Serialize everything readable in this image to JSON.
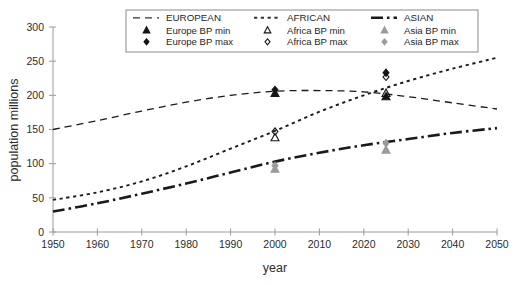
{
  "axes": {
    "xlabel": "year",
    "ylabel": "population  millions",
    "xticks": [
      "1950",
      "1960",
      "1970",
      "1980",
      "1990",
      "2000",
      "2010",
      "2020",
      "2030",
      "2040",
      "2050"
    ],
    "yticks": [
      "0",
      "50",
      "100",
      "150",
      "200",
      "250",
      "300"
    ]
  },
  "legend": {
    "columns": [
      {
        "header": "EUROPEAN",
        "header_icon": "dashed-line-swatch",
        "entries": [
          {
            "label": "Europe  BP min",
            "icon": "filled-triangle-marker"
          },
          {
            "label": "Europe BP max",
            "icon": "filled-diamond-marker"
          }
        ]
      },
      {
        "header": "AFRICAN",
        "header_icon": "dotted-line-swatch",
        "entries": [
          {
            "label": "Africa BP min",
            "icon": "open-triangle-marker"
          },
          {
            "label": "Africa BP max",
            "icon": "open-diamond-marker"
          }
        ]
      },
      {
        "header": "ASIAN",
        "header_icon": "dashdot-line-swatch",
        "entries": [
          {
            "label": "Asia  BP min",
            "icon": "grey-triangle-marker"
          },
          {
            "label": "Asia BP max",
            "icon": "grey-diamond-marker"
          }
        ]
      }
    ]
  },
  "colors": {
    "european": "#333333",
    "african": "#333333",
    "asian": "#1a1a1a",
    "grey_marker": "#9b9b9b",
    "axis": "#9a9a9a",
    "background": "#ffffff"
  },
  "chart_data": {
    "type": "line",
    "title": "",
    "xlabel": "year",
    "ylabel": "population  millions",
    "xlim": [
      1950,
      2050
    ],
    "ylim": [
      0,
      300
    ],
    "grid": false,
    "legend_position": "top",
    "x": [
      1950,
      1960,
      1970,
      1980,
      1990,
      2000,
      2010,
      2020,
      2030,
      2040,
      2050
    ],
    "series": [
      {
        "name": "EUROPEAN",
        "style": "dashed",
        "values": [
          150,
          163,
          177,
          190,
          200,
          206,
          207,
          205,
          198,
          189,
          180
        ]
      },
      {
        "name": "AFRICAN",
        "style": "dotted",
        "values": [
          47,
          58,
          74,
          96,
          122,
          148,
          176,
          200,
          221,
          239,
          255
        ]
      },
      {
        "name": "ASIAN",
        "style": "dash-dot",
        "values": [
          30,
          42,
          56,
          71,
          87,
          103,
          116,
          127,
          136,
          145,
          152
        ]
      }
    ],
    "markers": [
      {
        "series": "Europe BP min",
        "x": 2000,
        "y": 203,
        "icon": "filled-triangle-marker"
      },
      {
        "series": "Europe BP max",
        "x": 2000,
        "y": 208,
        "icon": "filled-diamond-marker"
      },
      {
        "series": "Africa BP min",
        "x": 2000,
        "y": 138,
        "icon": "open-triangle-marker"
      },
      {
        "series": "Africa BP max",
        "x": 2000,
        "y": 147,
        "icon": "open-diamond-marker"
      },
      {
        "series": "Asia BP min",
        "x": 2000,
        "y": 92,
        "icon": "grey-triangle-marker"
      },
      {
        "series": "Asia BP max",
        "x": 2000,
        "y": 97,
        "icon": "grey-diamond-marker"
      },
      {
        "series": "Europe BP min",
        "x": 2025,
        "y": 198,
        "icon": "filled-triangle-marker"
      },
      {
        "series": "Europe BP max",
        "x": 2025,
        "y": 233,
        "icon": "filled-diamond-marker"
      },
      {
        "series": "Africa BP min",
        "x": 2025,
        "y": 203,
        "icon": "open-triangle-marker"
      },
      {
        "series": "Africa BP max",
        "x": 2025,
        "y": 227,
        "icon": "open-diamond-marker"
      },
      {
        "series": "Asia BP min",
        "x": 2025,
        "y": 120,
        "icon": "grey-triangle-marker"
      },
      {
        "series": "Asia BP max",
        "x": 2025,
        "y": 130,
        "icon": "grey-diamond-marker"
      }
    ]
  }
}
